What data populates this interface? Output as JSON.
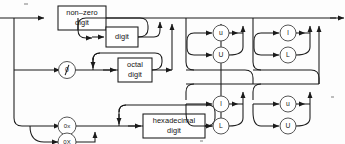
{
  "diagram": {
    "kind": "railroad-syntax-diagram",
    "stroke_color": "#1a1a1a",
    "box_fill": "#ffffff",
    "terminal_stroke": "#555555",
    "nonterminals": [
      {
        "id": "nonzero-digit",
        "label_line1": "non–zero",
        "label_line2": "digit"
      },
      {
        "id": "digit",
        "label_line1": "digit",
        "label_line2": ""
      },
      {
        "id": "octal-digit",
        "label_line1": "octal",
        "label_line2": "digit"
      },
      {
        "id": "hex-digit",
        "label_line1": "hexadecimal",
        "label_line2": "digit"
      }
    ],
    "terminals": [
      {
        "id": "zero",
        "label": "0"
      },
      {
        "id": "zero-x",
        "label": "0x"
      },
      {
        "id": "zero-X",
        "label": "0X"
      },
      {
        "id": "suffix-u-lower-top",
        "label": "u"
      },
      {
        "id": "suffix-U-upper-top",
        "label": "U"
      },
      {
        "id": "suffix-l-lower-top",
        "label": "l"
      },
      {
        "id": "suffix-L-upper-top",
        "label": "L"
      },
      {
        "id": "suffix-l-lower-bot",
        "label": "l"
      },
      {
        "id": "suffix-L-upper-bot",
        "label": "L"
      },
      {
        "id": "suffix-u-lower-bot",
        "label": "u"
      },
      {
        "id": "suffix-U-upper-bot",
        "label": "U"
      }
    ],
    "branches": [
      {
        "id": "decimal-branch",
        "sequence": [
          "non–zero digit",
          "digit (repeat)"
        ]
      },
      {
        "id": "octal-branch",
        "sequence": [
          "0",
          "octal digit (repeat)"
        ]
      },
      {
        "id": "hexadecimal-branch",
        "sequence": [
          "0x | 0X",
          "hexadecimal digit (repeat)"
        ]
      },
      {
        "id": "suffix-branch-ul",
        "sequence": [
          "u | U",
          "l | L"
        ]
      },
      {
        "id": "suffix-branch-lu",
        "sequence": [
          "l | L",
          "u | U"
        ]
      }
    ]
  }
}
